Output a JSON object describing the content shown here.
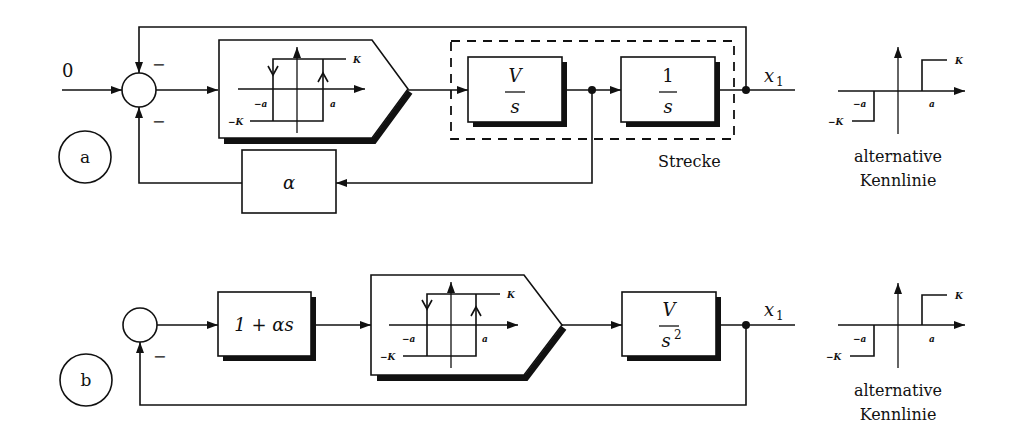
{
  "diagram_a": {
    "label": "a",
    "input_value": "0",
    "sum_sign_top": "−",
    "sum_sign_bottom": "−",
    "hysteresis": {
      "K": "K",
      "minus_K": "−K",
      "minus_a": "−a",
      "a": "a"
    },
    "block_integrator1": {
      "numerator": "V",
      "denominator": "s"
    },
    "block_integrator2": {
      "numerator": "1",
      "denominator": "s"
    },
    "plant_label": "Strecke",
    "feedback_block": "α",
    "output": {
      "var": "x",
      "subscript": "1"
    },
    "alternative_characteristic": {
      "K": "K",
      "minus_K": "−K",
      "minus_a": "−a",
      "a": "a",
      "caption_line1": "alternative",
      "caption_line2": "Kennlinie"
    }
  },
  "diagram_b": {
    "label": "b",
    "sum_sign_bottom": "−",
    "block_pd": "1 + αs",
    "hysteresis": {
      "K": "K",
      "minus_K": "−K",
      "minus_a": "−a",
      "a": "a"
    },
    "block_plant": {
      "numerator": "V",
      "denominator": "s",
      "exponent": "2"
    },
    "output": {
      "var": "x",
      "subscript": "1"
    },
    "alternative_characteristic": {
      "K": "K",
      "minus_K": "−K",
      "minus_a": "−a",
      "a": "a",
      "caption_line1": "alternative",
      "caption_line2": "Kennlinie"
    }
  }
}
